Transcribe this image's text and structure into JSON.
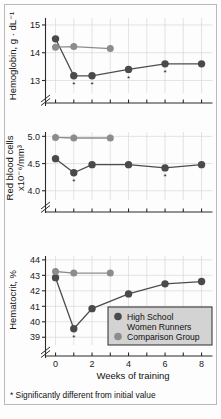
{
  "figure": {
    "footnote": "* Significantly different from initial value",
    "xlabel": "Weeks of training",
    "colors": {
      "runners": "#4a4a4a",
      "comparison": "#8c8c8c",
      "legend_background": "#d3d3d3",
      "axis": "#2b2b2b",
      "grid": "#d9d9d9",
      "frame": "#b9b9b9"
    }
  },
  "legend": {
    "items": [
      {
        "label_line1": "High School",
        "label_line2": "Women Runners",
        "marker": "dark-circle-marker"
      },
      {
        "label_line1": "Comparison Group",
        "label_line2": "",
        "marker": "light-circle-marker"
      }
    ]
  },
  "chart_data": [
    {
      "type": "line",
      "title": "",
      "panel": "hemoglobin",
      "ylabel": "Hemoglobin, g · dL⁻¹",
      "xlabel": "Weeks of training",
      "yticks": [
        13,
        14,
        15
      ],
      "ytick_labels": [
        "13",
        "14",
        "15"
      ],
      "ylim": [
        12.55,
        15.25
      ],
      "xlim": [
        -0.55,
        8.6
      ],
      "xticks": [
        0,
        1,
        2,
        3,
        4,
        5,
        6,
        7,
        8
      ],
      "xtick_labels": [
        "0",
        "",
        "2",
        "",
        "4",
        "",
        "6",
        "",
        "8"
      ],
      "axis_break": true,
      "grid": true,
      "series": [
        {
          "name": "High School Women Runners",
          "color": "#4a4a4a",
          "x": [
            0,
            1,
            2,
            4,
            6,
            8
          ],
          "values": [
            14.5,
            13.17,
            13.17,
            13.4,
            13.6,
            13.6
          ],
          "significant_x": [
            1,
            2,
            4,
            6
          ]
        },
        {
          "name": "Comparison Group",
          "color": "#8c8c8c",
          "x": [
            0,
            1,
            3
          ],
          "values": [
            14.2,
            14.22,
            14.15
          ],
          "significant_x": []
        }
      ]
    },
    {
      "type": "line",
      "title": "",
      "panel": "red-blood-cells",
      "ylabel": "Red blood cells x10⁻⁶/mm³",
      "ylabel_line1": "Red blood cells",
      "ylabel_line2": "x10⁻⁶/mm³",
      "xlabel": "Weeks of training",
      "yticks": [
        4.0,
        4.5,
        5.0
      ],
      "ytick_labels": [
        "4.0",
        "4.5",
        "5.0"
      ],
      "ylim": [
        3.83,
        5.08
      ],
      "xlim": [
        -0.55,
        8.6
      ],
      "xticks": [
        0,
        1,
        2,
        3,
        4,
        5,
        6,
        7,
        8
      ],
      "xtick_labels": [
        "0",
        "",
        "2",
        "",
        "4",
        "",
        "6",
        "",
        "8"
      ],
      "axis_break": true,
      "grid": true,
      "series": [
        {
          "name": "High School Women Runners",
          "color": "#4a4a4a",
          "x": [
            0,
            1,
            2,
            4,
            6,
            8
          ],
          "values": [
            4.59,
            4.33,
            4.48,
            4.48,
            4.42,
            4.48
          ],
          "significant_x": [
            1,
            6
          ]
        },
        {
          "name": "Comparison Group",
          "color": "#8c8c8c",
          "x": [
            0,
            1,
            3
          ],
          "values": [
            4.98,
            4.97,
            4.97
          ],
          "significant_x": []
        }
      ]
    },
    {
      "type": "line",
      "title": "",
      "panel": "hematocrit",
      "ylabel": "Hematocrit, %",
      "xlabel": "Weeks of training",
      "yticks": [
        39,
        40,
        41,
        42,
        43,
        44
      ],
      "ytick_labels": [
        "39",
        "40",
        "41",
        "42",
        "43",
        "44"
      ],
      "ylim": [
        38.5,
        44.25
      ],
      "xlim": [
        -0.55,
        8.6
      ],
      "xticks": [
        0,
        1,
        2,
        3,
        4,
        5,
        6,
        7,
        8
      ],
      "xtick_labels": [
        "0",
        "",
        "2",
        "",
        "4",
        "",
        "6",
        "",
        "8"
      ],
      "axis_break": true,
      "grid": true,
      "series": [
        {
          "name": "High School Women Runners",
          "color": "#4a4a4a",
          "x": [
            0,
            1,
            2,
            4,
            6,
            8
          ],
          "values": [
            42.85,
            39.55,
            40.85,
            41.8,
            42.45,
            42.6
          ],
          "significant_x": [
            1
          ]
        },
        {
          "name": "Comparison Group",
          "color": "#8c8c8c",
          "x": [
            0,
            1,
            3
          ],
          "values": [
            43.25,
            43.15,
            43.15
          ],
          "significant_x": []
        }
      ]
    }
  ]
}
